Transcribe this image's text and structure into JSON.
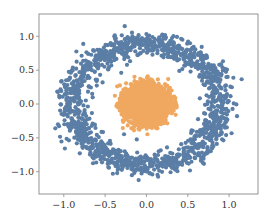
{
  "chart_data": {
    "type": "scatter",
    "title": "",
    "xlabel": "",
    "ylabel": "",
    "xlim": [
      -1.3,
      1.35
    ],
    "ylim": [
      -1.33,
      1.33
    ],
    "xticks": [
      -1.0,
      -0.5,
      0.0,
      0.5,
      1.0
    ],
    "xtick_labels": [
      "−1.0",
      "−0.5",
      "0.0",
      "0.5",
      "1.0"
    ],
    "yticks": [
      1.0,
      0.5,
      0.0,
      -0.5,
      -1.0
    ],
    "ytick_labels": [
      "1.0",
      "0.5",
      "0.0",
      "−0.5",
      "−1.0"
    ],
    "grid": false,
    "legend": null,
    "series": [
      {
        "name": "outer ring",
        "color": "#5b7ea6",
        "shape": "annulus",
        "center": [
          0.0,
          0.0
        ],
        "radius_mean": 1.0,
        "radius_noise": 0.09,
        "n_points": 1400
      },
      {
        "name": "inner disk",
        "color": "#f0a860",
        "shape": "disk",
        "center": [
          0.0,
          0.0
        ],
        "radius_mean": 0.4,
        "radius_noise": 0.09,
        "n_points": 1400
      }
    ]
  },
  "layout": {
    "plot_box": {
      "left": 39,
      "top": 14,
      "right": 258,
      "bottom": 194
    },
    "axis_color": "#888888",
    "point_radius": 2.1
  }
}
